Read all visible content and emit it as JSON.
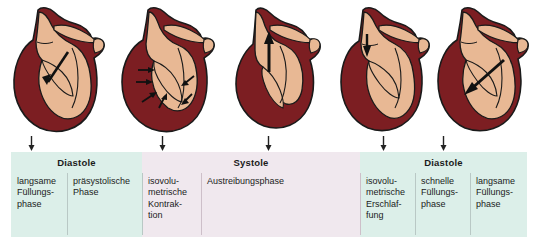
{
  "figure": {
    "colors": {
      "diastole_band": "#dcefe9",
      "systole_band": "#f0e8ee",
      "myocardium": "#7c1e22",
      "chamber": "#e8b894",
      "outline": "#1a1a1a",
      "arrow": "#111111",
      "divider": "#b9c8c5"
    }
  },
  "hearts": [
    {
      "id": "heart-1",
      "name": "heart-diagram-slow-filling",
      "arrow": "large-arrow-down-right-into-ventricle",
      "phase_ref": "langsame Füllungsphase"
    },
    {
      "id": "heart-2",
      "name": "heart-diagram-presystolic",
      "arrow": "multiple-small-arrows-inward-atrial-contraction",
      "phase_ref": "präsystolische Phase"
    },
    {
      "id": "heart-3",
      "name": "heart-diagram-ejection",
      "arrow": "large-arrow-up-through-aorta",
      "phase_ref": "Austreibungsphase"
    },
    {
      "id": "heart-4",
      "name": "heart-diagram-isovolumetric-relaxation",
      "arrow": "small-arrow-down-at-aortic-valve",
      "phase_ref": "isovolumetrische Erschlaffung"
    },
    {
      "id": "heart-5",
      "name": "heart-diagram-rapid-filling",
      "arrow": "large-arrow-down-left-into-ventricle",
      "phase_ref": "schnelle Füllungsphase"
    }
  ],
  "tick_markers": [
    {
      "name": "tick-arrow-1",
      "glyph": "arrow-down-icon"
    },
    {
      "name": "tick-arrow-2",
      "glyph": "arrow-down-icon"
    },
    {
      "name": "tick-arrow-3",
      "glyph": "arrow-down-icon"
    },
    {
      "name": "tick-arrow-4",
      "glyph": "arrow-down-icon"
    },
    {
      "name": "tick-arrow-5",
      "glyph": "arrow-down-icon"
    }
  ],
  "phases": {
    "diastole_left": "Diastole",
    "systole": "Systole",
    "diastole_right": "Diastole"
  },
  "columns": [
    {
      "id": "col-1",
      "text": "langsame Füllungs-phase",
      "lines": [
        "langsame",
        "Füllungs-",
        "phase"
      ],
      "band": "diastole"
    },
    {
      "id": "col-2",
      "text": "präsystolische Phase",
      "lines": [
        "präsystolische",
        "Phase"
      ],
      "band": "diastole"
    },
    {
      "id": "col-3",
      "text": "isovolumetrische Kontraktion",
      "lines": [
        "isovolu-",
        "metrische",
        "Kontrak-",
        "tion"
      ],
      "band": "systole"
    },
    {
      "id": "col-4",
      "text": "Austreibungsphase",
      "lines": [
        "Austreibungsphase"
      ],
      "band": "systole"
    },
    {
      "id": "col-5",
      "text": "isovolumetrische Erschlaffung",
      "lines": [
        "isovolu-",
        "metrische",
        "Erschlaf-",
        "fung"
      ],
      "band": "diastole"
    },
    {
      "id": "col-6",
      "text": "schnelle Füllungsphase",
      "lines": [
        "schnelle",
        "Füllungs-",
        "phase"
      ],
      "band": "diastole"
    },
    {
      "id": "col-7",
      "text": "langsame Füllungsphase",
      "lines": [
        "langsame",
        "Füllungs-",
        "phase"
      ],
      "band": "diastole"
    }
  ]
}
